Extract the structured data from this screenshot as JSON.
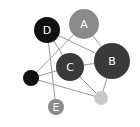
{
  "diagram": {
    "type": "network-graph",
    "nodes": [
      {
        "id": "D",
        "label": "D",
        "cx": 47,
        "cy": 30,
        "r": 13,
        "color": "#111111"
      },
      {
        "id": "A",
        "label": "A",
        "cx": 84,
        "cy": 24,
        "r": 15,
        "color": "#8a8a8a"
      },
      {
        "id": "B",
        "label": "B",
        "cx": 112,
        "cy": 61,
        "r": 18,
        "color": "#3a3a3a"
      },
      {
        "id": "C",
        "label": "C",
        "cx": 70,
        "cy": 67,
        "r": 14,
        "color": "#3a3a3a"
      },
      {
        "id": "N1",
        "label": "",
        "cx": 31,
        "cy": 78,
        "r": 8,
        "color": "#111111"
      },
      {
        "id": "E",
        "label": "E",
        "cx": 56,
        "cy": 107,
        "r": 8,
        "color": "#8a8a8a"
      },
      {
        "id": "N2",
        "label": "",
        "cx": 101,
        "cy": 98,
        "r": 7,
        "color": "#c8c8c8"
      }
    ],
    "edges": [
      [
        "D",
        "B"
      ],
      [
        "D",
        "C"
      ],
      [
        "D",
        "E"
      ],
      [
        "A",
        "B"
      ],
      [
        "A",
        "N1"
      ],
      [
        "N1",
        "C"
      ],
      [
        "N1",
        "N2"
      ],
      [
        "C",
        "B"
      ],
      [
        "C",
        "N2"
      ],
      [
        "B",
        "N2"
      ]
    ]
  }
}
